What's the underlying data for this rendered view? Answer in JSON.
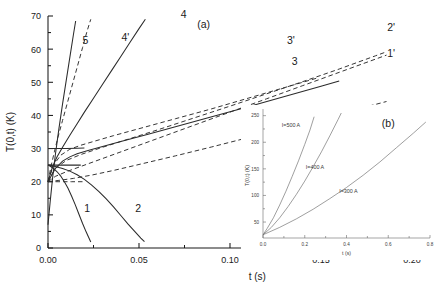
{
  "figure": {
    "panel_a_label": "(a)",
    "panel_b_label": "(b)"
  },
  "chart_data": [
    {
      "type": "line",
      "id": "panel-a",
      "title": "(a)",
      "xlabel": "t (s)",
      "ylabel": "T(0,t) (K)",
      "xlim": [
        0.0,
        0.2
      ],
      "ylim": [
        0,
        70
      ],
      "xticks": [
        0.0,
        0.05,
        0.1,
        0.15,
        0.2
      ],
      "xtick_labels": [
        "0.00",
        "0.05",
        "0.10",
        "0.15",
        "0.20"
      ],
      "yticks": [
        0,
        10,
        20,
        30,
        40,
        50,
        60,
        70
      ],
      "ytick_labels": [
        "0",
        "10",
        "20",
        "30",
        "40",
        "50",
        "60",
        "70"
      ],
      "grid": false,
      "legend": "none",
      "series": [
        {
          "name": "1",
          "label": "1",
          "style": "solid",
          "label_x": 0.0215,
          "label_y": 11.0,
          "points": [
            [
              0.0,
              25.0
            ],
            [
              0.0015,
              24.6
            ],
            [
              0.003,
              24.0
            ],
            [
              0.005,
              23.0
            ],
            [
              0.007,
              21.7
            ],
            [
              0.009,
              20.0
            ],
            [
              0.011,
              18.0
            ],
            [
              0.013,
              15.6
            ],
            [
              0.015,
              13.0
            ],
            [
              0.017,
              10.2
            ],
            [
              0.019,
              7.4
            ],
            [
              0.021,
              4.8
            ],
            [
              0.0225,
              3.0
            ],
            [
              0.0235,
              1.8
            ]
          ]
        },
        {
          "name": "2",
          "label": "2",
          "style": "solid",
          "label_x": 0.0495,
          "label_y": 11.0,
          "points": [
            [
              0.0,
              25.0
            ],
            [
              0.004,
              24.6
            ],
            [
              0.008,
              24.0
            ],
            [
              0.012,
              23.2
            ],
            [
              0.016,
              22.1
            ],
            [
              0.02,
              20.7
            ],
            [
              0.024,
              19.0
            ],
            [
              0.028,
              17.0
            ],
            [
              0.032,
              14.8
            ],
            [
              0.036,
              12.4
            ],
            [
              0.04,
              9.8
            ],
            [
              0.044,
              7.2
            ],
            [
              0.048,
              4.8
            ],
            [
              0.051,
              3.0
            ],
            [
              0.053,
              1.9
            ]
          ]
        },
        {
          "name": "3",
          "label": "3",
          "style": "solid",
          "label_x": 0.1355,
          "label_y": 55.3,
          "points": [
            [
              0.0,
              20.0
            ],
            [
              0.004,
              24.0
            ],
            [
              0.008,
              26.2
            ],
            [
              0.012,
              27.5
            ],
            [
              0.016,
              28.4
            ],
            [
              0.022,
              29.4
            ],
            [
              0.03,
              30.6
            ],
            [
              0.04,
              32.1
            ],
            [
              0.055,
              34.3
            ],
            [
              0.07,
              36.6
            ],
            [
              0.09,
              39.6
            ],
            [
              0.11,
              42.6
            ],
            [
              0.13,
              45.7
            ],
            [
              0.15,
              48.8
            ],
            [
              0.16,
              50.4
            ]
          ]
        },
        {
          "name": "4",
          "label": "4",
          "style": "solid",
          "label_x": 0.0745,
          "label_y": 69.5,
          "points": [
            [
              0.0,
              20.0
            ],
            [
              0.0025,
              24.5
            ],
            [
              0.005,
              27.5
            ],
            [
              0.008,
              30.4
            ],
            [
              0.012,
              34.0
            ],
            [
              0.016,
              37.5
            ],
            [
              0.02,
              41.0
            ],
            [
              0.025,
              45.2
            ],
            [
              0.03,
              49.4
            ],
            [
              0.035,
              53.6
            ],
            [
              0.04,
              57.8
            ],
            [
              0.045,
              62.0
            ],
            [
              0.05,
              66.2
            ],
            [
              0.0535,
              69.0
            ]
          ]
        },
        {
          "name": "5",
          "label": "5",
          "style": "solid",
          "label_x": 0.0205,
          "label_y": 61.5,
          "points": [
            [
              0.0,
              7.0
            ],
            [
              0.0012,
              14.0
            ],
            [
              0.0025,
              21.0
            ],
            [
              0.004,
              28.0
            ],
            [
              0.006,
              36.0
            ],
            [
              0.008,
              43.5
            ],
            [
              0.01,
              50.5
            ],
            [
              0.012,
              57.5
            ],
            [
              0.014,
              64.5
            ],
            [
              0.0152,
              68.5
            ]
          ]
        },
        {
          "name": "1'",
          "label": "1'",
          "style": "dashed",
          "label_x": 0.1885,
          "label_y": 57.6,
          "points": [
            [
              0.0,
              20.0
            ],
            [
              0.004,
              21.6
            ],
            [
              0.01,
              23.0
            ],
            [
              0.018,
              24.6
            ],
            [
              0.03,
              27.0
            ],
            [
              0.045,
              30.0
            ],
            [
              0.06,
              33.0
            ],
            [
              0.08,
              37.0
            ],
            [
              0.1,
              41.0
            ],
            [
              0.12,
              45.0
            ],
            [
              0.14,
              49.0
            ],
            [
              0.16,
              53.0
            ],
            [
              0.18,
              57.0
            ],
            [
              0.186,
              58.2
            ]
          ]
        },
        {
          "name": "2'",
          "label": "2'",
          "style": "dashed",
          "label_x": 0.1885,
          "label_y": 65.6,
          "points": [
            [
              0.0,
              20.0
            ],
            [
              0.004,
              24.0
            ],
            [
              0.01,
              26.4
            ],
            [
              0.018,
              28.2
            ],
            [
              0.03,
              30.4
            ],
            [
              0.045,
              33.0
            ],
            [
              0.06,
              35.6
            ],
            [
              0.08,
              39.2
            ],
            [
              0.1,
              42.8
            ],
            [
              0.12,
              46.5
            ],
            [
              0.14,
              50.2
            ],
            [
              0.16,
              54.0
            ],
            [
              0.18,
              58.0
            ],
            [
              0.186,
              59.2
            ]
          ]
        },
        {
          "name": "3'",
          "label": "3'",
          "style": "dashed",
          "label_x": 0.1335,
          "label_y": 61.5,
          "points": [
            [
              0.0,
              20.0
            ],
            [
              0.003,
              25.0
            ],
            [
              0.007,
              28.0
            ],
            [
              0.012,
              29.8
            ],
            [
              0.018,
              31.0
            ],
            [
              0.026,
              32.3
            ],
            [
              0.036,
              33.9
            ],
            [
              0.05,
              36.0
            ],
            [
              0.07,
              39.0
            ],
            [
              0.09,
              42.0
            ],
            [
              0.11,
              45.2
            ],
            [
              0.13,
              48.4
            ],
            [
              0.148,
              51.3
            ]
          ]
        },
        {
          "name": "4'",
          "label": "4'",
          "style": "dashed",
          "label_x": 0.0425,
          "label_y": 62.6,
          "points": [
            [
              0.0,
              20.0
            ],
            [
              0.0018,
              25.0
            ],
            [
              0.0035,
              29.0
            ],
            [
              0.0055,
              33.5
            ],
            [
              0.008,
              38.5
            ],
            [
              0.0105,
              43.5
            ],
            [
              0.013,
              48.5
            ],
            [
              0.016,
              54.5
            ],
            [
              0.019,
              60.5
            ],
            [
              0.0215,
              65.5
            ],
            [
              0.0235,
              69.0
            ]
          ]
        },
        {
          "name": "lower-dashed",
          "label": "",
          "style": "dashed",
          "label_x": null,
          "label_y": null,
          "points": [
            [
              0.0,
              20.0
            ],
            [
              0.006,
              20.4
            ],
            [
              0.014,
              21.0
            ],
            [
              0.024,
              22.0
            ],
            [
              0.036,
              23.4
            ],
            [
              0.05,
              25.2
            ],
            [
              0.07,
              27.8
            ],
            [
              0.09,
              30.5
            ],
            [
              0.11,
              33.3
            ],
            [
              0.13,
              36.1
            ],
            [
              0.15,
              39.0
            ],
            [
              0.17,
              41.9
            ],
            [
              0.186,
              44.2
            ]
          ]
        },
        {
          "name": "upper-flat-solid",
          "label": "",
          "style": "solid",
          "label_x": null,
          "label_y": null,
          "points": [
            [
              0.0,
              30.0
            ],
            [
              0.004,
              30.0
            ],
            [
              0.01,
              30.0
            ],
            [
              0.016,
              30.1
            ],
            [
              0.02,
              30.2
            ]
          ]
        },
        {
          "name": "mid-flat-solid",
          "label": "",
          "style": "solid",
          "label_x": null,
          "label_y": null,
          "points": [
            [
              0.0,
              25.0
            ],
            [
              0.005,
              25.0
            ],
            [
              0.012,
              25.0
            ],
            [
              0.018,
              25.0
            ]
          ]
        },
        {
          "name": "low-flat-dashed",
          "label": "",
          "style": "dashed",
          "label_x": null,
          "label_y": null,
          "points": [
            [
              0.0,
              20.0
            ],
            [
              0.006,
              20.0
            ],
            [
              0.013,
              20.0
            ],
            [
              0.019,
              20.0
            ]
          ]
        }
      ]
    },
    {
      "type": "line",
      "id": "panel-b",
      "title": "(b)",
      "xlabel": "t (s)",
      "ylabel": "T(0,t) (K)",
      "xlim": [
        0.0,
        0.8
      ],
      "ylim": [
        20,
        255
      ],
      "xticks": [
        0.0,
        0.2,
        0.4,
        0.6,
        0.8
      ],
      "xtick_labels": [
        "0.0",
        "0.2",
        "0.4",
        "0.6",
        "0.8"
      ],
      "yticks": [
        50,
        100,
        150,
        200,
        250
      ],
      "ytick_labels": [
        "50",
        "100",
        "150",
        "200",
        "250"
      ],
      "grid": false,
      "legend": "inline-annotations",
      "series": [
        {
          "name": "I=500 A",
          "label": "I=500 A",
          "style": "solid",
          "label_x": 0.09,
          "label_y": 228,
          "points": [
            [
              0.0,
              26
            ],
            [
              0.02,
              38
            ],
            [
              0.05,
              58
            ],
            [
              0.08,
              82
            ],
            [
              0.11,
              108
            ],
            [
              0.14,
              136
            ],
            [
              0.17,
              165
            ],
            [
              0.2,
              196
            ],
            [
              0.225,
              223
            ],
            [
              0.245,
              248
            ]
          ]
        },
        {
          "name": "I=400 A",
          "label": "I=400 A",
          "style": "solid",
          "label_x": 0.205,
          "label_y": 150,
          "points": [
            [
              0.0,
              26
            ],
            [
              0.04,
              40
            ],
            [
              0.08,
              58
            ],
            [
              0.12,
              79
            ],
            [
              0.16,
              102
            ],
            [
              0.2,
              127
            ],
            [
              0.24,
              154
            ],
            [
              0.28,
              182
            ],
            [
              0.32,
              212
            ],
            [
              0.36,
              243
            ],
            [
              0.375,
              255
            ]
          ]
        },
        {
          "name": "I=300 A",
          "label": "I=300 A",
          "style": "solid",
          "label_x": 0.365,
          "label_y": 104,
          "points": [
            [
              0.0,
              26
            ],
            [
              0.08,
              40
            ],
            [
              0.16,
              56
            ],
            [
              0.24,
              74
            ],
            [
              0.32,
              94
            ],
            [
              0.4,
              115
            ],
            [
              0.48,
              138
            ],
            [
              0.56,
              163
            ],
            [
              0.64,
              190
            ],
            [
              0.72,
              217
            ],
            [
              0.78,
              238
            ]
          ]
        }
      ]
    }
  ]
}
